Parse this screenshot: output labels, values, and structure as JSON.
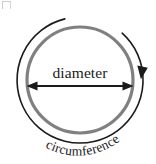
{
  "figure": {
    "name": "circle-diameter-circumference-diagram",
    "background_color": "#ffffff",
    "labels": {
      "diameter": "diameter",
      "circumference": "circumference"
    },
    "colors": {
      "circle_stroke": "#808080",
      "arc_stroke": "#1a1a1a",
      "arrow_stroke": "#1a1a1a",
      "text": "#1a1a1a",
      "background": "#ffffff"
    },
    "geometry": {
      "center_x": 80,
      "center_y": 80,
      "circle_radius": 53,
      "circle_stroke_width": 3.2,
      "arc_radius": 63,
      "arc_stroke_width": 1.6,
      "arc_start_angle_deg": 228,
      "arc_end_angle_deg": 76,
      "diameter_line_y": 86,
      "diameter_line_x1": 27,
      "diameter_line_x2": 133,
      "diameter_label_y": 73,
      "circumference_text_radius": 68
    },
    "icons": {
      "arrowhead_left": "arrow-left-icon",
      "arrowhead_right": "arrow-right-icon",
      "arrowhead_arc": "arrow-down-icon"
    }
  }
}
